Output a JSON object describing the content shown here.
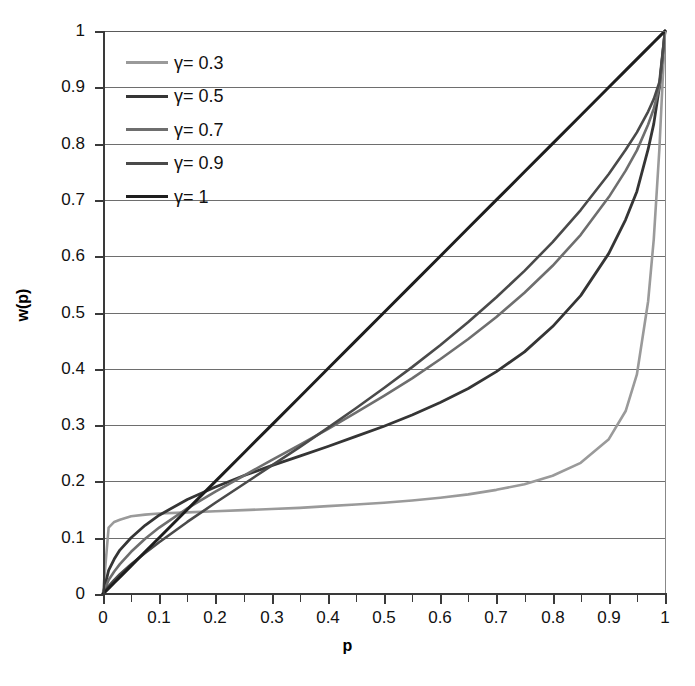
{
  "chart_data": {
    "type": "line",
    "title": "",
    "xlabel": "p",
    "ylabel": "w(p)",
    "xlim": [
      0,
      1
    ],
    "ylim": [
      0,
      1
    ],
    "grid": true,
    "legend_position": "top-left",
    "x_ticks": [
      "0",
      "0.1",
      "0.2",
      "0.3",
      "0.4",
      "0.5",
      "0.6",
      "0.7",
      "0.8",
      "0.9",
      "1"
    ],
    "y_ticks": [
      "0",
      "0.1",
      "0.2",
      "0.3",
      "0.4",
      "0.5",
      "0.6",
      "0.7",
      "0.8",
      "0.9",
      "1"
    ],
    "x_tick_values": [
      0,
      0.1,
      0.2,
      0.3,
      0.4,
      0.5,
      0.6,
      0.7,
      0.8,
      0.9,
      1
    ],
    "y_tick_values": [
      0,
      0.1,
      0.2,
      0.3,
      0.4,
      0.5,
      0.6,
      0.7,
      0.8,
      0.9,
      1
    ],
    "x": [
      0,
      0.01,
      0.02,
      0.03,
      0.05,
      0.075,
      0.1,
      0.15,
      0.2,
      0.25,
      0.3,
      0.35,
      0.4,
      0.45,
      0.5,
      0.55,
      0.6,
      0.65,
      0.7,
      0.75,
      0.8,
      0.85,
      0.9,
      0.93,
      0.95,
      0.97,
      0.98,
      0.99,
      1
    ],
    "series": [
      {
        "name": "γ=0.3",
        "label": "γ= 0.3",
        "gamma": 0.3,
        "color": "#9a9a9a",
        "width": 2.6,
        "values": [
          0,
          0.118,
          0.128,
          0.132,
          0.138,
          0.141,
          0.143,
          0.145,
          0.147,
          0.149,
          0.151,
          0.153,
          0.156,
          0.159,
          0.162,
          0.166,
          0.171,
          0.177,
          0.185,
          0.195,
          0.21,
          0.233,
          0.275,
          0.325,
          0.39,
          0.52,
          0.63,
          0.79,
          1
        ]
      },
      {
        "name": "γ=0.5",
        "label": "γ= 0.5",
        "gamma": 0.5,
        "color": "#353535",
        "width": 2.8,
        "values": [
          0,
          0.042,
          0.062,
          0.078,
          0.1,
          0.122,
          0.14,
          0.168,
          0.19,
          0.21,
          0.228,
          0.245,
          0.262,
          0.28,
          0.298,
          0.318,
          0.34,
          0.365,
          0.395,
          0.43,
          0.475,
          0.53,
          0.605,
          0.665,
          0.715,
          0.79,
          0.835,
          0.9,
          1
        ]
      },
      {
        "name": "γ=0.7",
        "label": "γ= 0.7",
        "gamma": 0.7,
        "color": "#6e6e6e",
        "width": 2.6,
        "values": [
          0,
          0.025,
          0.04,
          0.053,
          0.075,
          0.098,
          0.118,
          0.152,
          0.182,
          0.21,
          0.238,
          0.265,
          0.293,
          0.322,
          0.352,
          0.383,
          0.417,
          0.453,
          0.492,
          0.535,
          0.583,
          0.638,
          0.705,
          0.752,
          0.788,
          0.834,
          0.862,
          0.9,
          1
        ]
      },
      {
        "name": "γ=0.9",
        "label": "γ= 0.9",
        "gamma": 0.9,
        "color": "#4a4a4a",
        "width": 2.6,
        "values": [
          0,
          0.014,
          0.025,
          0.035,
          0.053,
          0.073,
          0.092,
          0.128,
          0.162,
          0.195,
          0.228,
          0.261,
          0.295,
          0.33,
          0.366,
          0.403,
          0.442,
          0.483,
          0.527,
          0.574,
          0.625,
          0.682,
          0.746,
          0.789,
          0.82,
          0.857,
          0.879,
          0.909,
          1
        ]
      },
      {
        "name": "γ=1",
        "label": "γ= 1",
        "gamma": 1,
        "color": "#1e1e1e",
        "width": 3.0,
        "values": [
          0,
          0.01,
          0.02,
          0.03,
          0.05,
          0.075,
          0.1,
          0.15,
          0.2,
          0.25,
          0.3,
          0.35,
          0.4,
          0.45,
          0.5,
          0.55,
          0.6,
          0.65,
          0.7,
          0.75,
          0.8,
          0.85,
          0.9,
          0.93,
          0.95,
          0.97,
          0.98,
          0.99,
          1
        ]
      }
    ]
  }
}
